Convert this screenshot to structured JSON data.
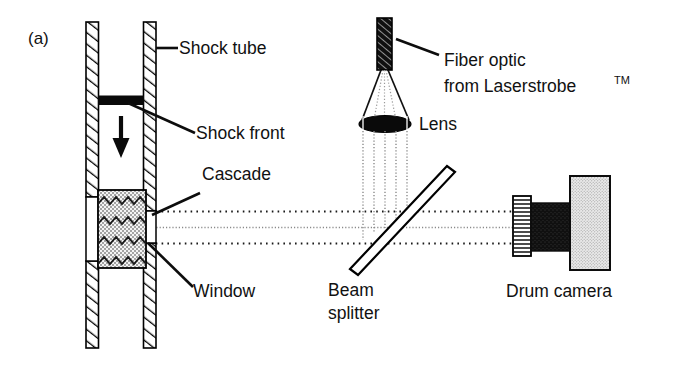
{
  "figure": {
    "panel_label": "(a)",
    "background_color": "#ffffff",
    "ink_color": "#111111",
    "width": 695,
    "height": 375
  },
  "labels": {
    "shock_tube": "Shock tube",
    "shock_front": "Shock front",
    "cascade": "Cascade",
    "window": "Window",
    "fiber_optic_line1": "Fiber optic",
    "fiber_optic_line2_main": "from Laserstrobe",
    "fiber_optic_line2_sup": "TM",
    "lens": "Lens",
    "beam_splitter_line1": "Beam",
    "beam_splitter_line2": "splitter",
    "drum_camera": "Drum camera"
  },
  "components": {
    "shock_tube": {
      "name": "shock-tube",
      "fill": "#ffffff",
      "hatch": "diagonal",
      "stroke": "#000000"
    },
    "shock_front": {
      "name": "shock-front",
      "fill": "#0a0a0a"
    },
    "flow_arrow": {
      "name": "flow-direction-arrow",
      "direction": "down",
      "fill": "#0a0a0a"
    },
    "cascade": {
      "name": "cascade",
      "pattern": "chevron-stipple",
      "fill": "#f2f2f2"
    },
    "window": {
      "name": "window",
      "fill": "#ffffff"
    },
    "fiber_optic": {
      "name": "fiber-optic-tip",
      "fill": "#111111",
      "hatch": "diagonal"
    },
    "lens": {
      "name": "lens",
      "shape": "ellipse",
      "fill": "#0a0a0a"
    },
    "beam_splitter": {
      "name": "beam-splitter",
      "shape": "tilted-plate",
      "angle_deg": 46,
      "fill": "#ffffff"
    },
    "drum_camera": {
      "name": "drum-camera",
      "barrel_fill": "#ffffff",
      "body_fill": "#141414",
      "drum_fill": "#e4e4e4"
    },
    "beam_paths": {
      "name": "optical-beam-paths",
      "style": "dotted",
      "count": 3
    }
  }
}
